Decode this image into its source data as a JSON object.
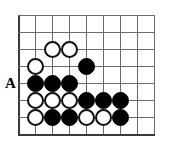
{
  "figure": {
    "name": "go-board-diagram",
    "type": "go-problem-diagram",
    "board": {
      "origin_x": 18,
      "origin_y": 15,
      "cell": 17,
      "cols": 9,
      "rows": 8,
      "line_color": "#6b6b6b",
      "edge_color": "#3a3a3a",
      "background": "#ffffff",
      "left_edge_is_board_edge": true,
      "bottom_edge_is_board_edge": true
    },
    "stone_radius": 8,
    "colors": {
      "black_stone": "#000000",
      "white_stone": "#ffffff",
      "white_stone_outline": "#111111",
      "label": "#000000"
    },
    "stones": [
      {
        "color": "white",
        "col": 2,
        "row": 2
      },
      {
        "color": "white",
        "col": 3,
        "row": 2
      },
      {
        "color": "white",
        "col": 1,
        "row": 3
      },
      {
        "color": "black",
        "col": 4,
        "row": 3
      },
      {
        "color": "black",
        "col": 1,
        "row": 4
      },
      {
        "color": "black",
        "col": 2,
        "row": 4
      },
      {
        "color": "black",
        "col": 3,
        "row": 4
      },
      {
        "color": "white",
        "col": 1,
        "row": 5
      },
      {
        "color": "white",
        "col": 2,
        "row": 5
      },
      {
        "color": "white",
        "col": 3,
        "row": 5
      },
      {
        "color": "black",
        "col": 4,
        "row": 5
      },
      {
        "color": "black",
        "col": 5,
        "row": 5
      },
      {
        "color": "black",
        "col": 6,
        "row": 5
      },
      {
        "color": "white",
        "col": 1,
        "row": 6
      },
      {
        "color": "black",
        "col": 2,
        "row": 6
      },
      {
        "color": "black",
        "col": 3,
        "row": 6
      },
      {
        "color": "white",
        "col": 4,
        "row": 6
      },
      {
        "color": "white",
        "col": 5,
        "row": 6
      },
      {
        "color": "black",
        "col": 6,
        "row": 6
      }
    ],
    "labels": [
      {
        "text": "A",
        "x": 5,
        "y": 76,
        "for_point": {
          "col": 0,
          "row": 4
        }
      }
    ]
  }
}
